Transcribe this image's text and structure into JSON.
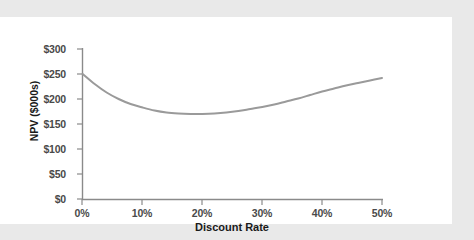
{
  "chart_data": {
    "type": "line",
    "title": "",
    "subtitle": "",
    "xlabel": "Discount Rate",
    "ylabel": "NPV ($000s)",
    "xlim": [
      0,
      50
    ],
    "ylim": [
      0,
      300
    ],
    "grid": false,
    "legend": null,
    "legend_position": "none",
    "line_color": "#9a9a9a",
    "axis_color": "#8a8a8a",
    "x_tick_labels": [
      "0%",
      "10%",
      "20%",
      "30%",
      "40%",
      "50%"
    ],
    "x_tick_values": [
      0,
      10,
      20,
      30,
      40,
      50
    ],
    "y_tick_labels": [
      "$0",
      "$50",
      "$100",
      "$150",
      "$200",
      "$250",
      "$300"
    ],
    "y_tick_values": [
      0,
      50,
      100,
      150,
      200,
      250,
      300
    ],
    "series": [
      {
        "name": "NPV",
        "x": [
          0,
          2,
          4,
          6,
          8,
          10,
          12,
          14,
          16,
          18,
          19,
          20,
          22,
          24,
          26,
          28,
          30,
          32,
          34,
          36,
          38,
          40,
          42,
          44,
          46,
          48,
          50
        ],
        "values": [
          250,
          230,
          213,
          200,
          190,
          183,
          177,
          173,
          171,
          170,
          170,
          170,
          171,
          173,
          176,
          180,
          184,
          189,
          195,
          201,
          208,
          215,
          221,
          227,
          232,
          237,
          242
        ]
      }
    ],
    "annotations": [],
    "notes": {
      "minimum_label": "minimum NPV approx $170K near a 19% discount rate",
      "start_label": "$250K at 0%",
      "end_label": "$242K at 50%"
    }
  },
  "page": {
    "background_color": "#e9e9e9",
    "paper_color": "#ffffff"
  }
}
